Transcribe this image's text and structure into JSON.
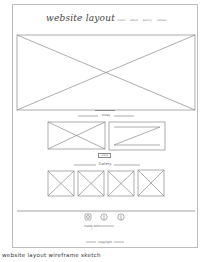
{
  "header": {
    "title": "website layout",
    "nav": [
      "home",
      "about",
      "gallery",
      "contact"
    ]
  },
  "sections": {
    "hero": {
      "type": "image-placeholder"
    },
    "feature": {
      "label": "today",
      "button_label": "more"
    },
    "gallery": {
      "label": "Gallery",
      "items": 4
    },
    "footer": {
      "social_icons": [
        "instagram-icon",
        "pinterest-icon",
        "facebook-icon"
      ],
      "tagline": "made with ♡",
      "copyright": "copyright"
    }
  },
  "caption": "website layout wireframe sketch"
}
